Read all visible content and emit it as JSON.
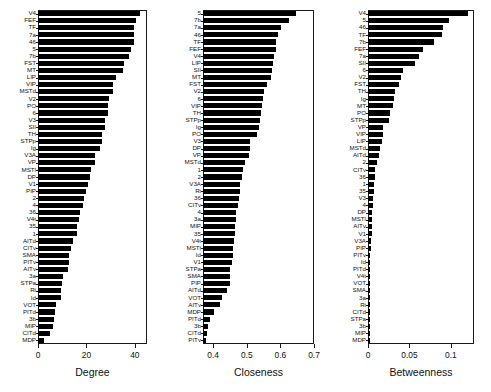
{
  "figure": {
    "background": "#ffffff",
    "bar_color": "#000000",
    "axis_color": "#1a1a1a",
    "text_color": "#111111"
  },
  "chart_data": [
    {
      "type": "bar",
      "orientation": "horizontal",
      "title": "",
      "xlabel": "Degree",
      "ylabel": "",
      "xlim": [
        0,
        45
      ],
      "xticks": [
        0,
        20,
        40
      ],
      "xticklabels": [
        "0",
        "20",
        "40"
      ],
      "grid": false,
      "legend": null,
      "categories": [
        "V4",
        "FEF",
        "TF",
        "7a",
        "46",
        "5",
        "7b",
        "FST",
        "MT",
        "LIP",
        "VIP",
        "MSTd",
        "V2",
        "PO",
        "6",
        "V3",
        "SII",
        "TH",
        "STPp",
        "Ig",
        "V3A",
        "VP",
        "MSTl",
        "DP",
        "V1",
        "PIP",
        "2",
        "4",
        "36",
        "V4t",
        "35",
        "1",
        "AITd",
        "CITv",
        "SMA",
        "PITv",
        "AITv",
        "3a",
        "STPa",
        "Ri",
        "Id",
        "VOT",
        "PITd",
        "3b",
        "MIP",
        "CITd",
        "MDP"
      ],
      "values": [
        42,
        40.5,
        39.5,
        39.5,
        39.5,
        38.5,
        37.5,
        35.5,
        35,
        32,
        31,
        31,
        29.5,
        29,
        29,
        27.5,
        27.5,
        26.5,
        26.5,
        25.5,
        23.5,
        23.5,
        22,
        21.5,
        20.5,
        20,
        19,
        18.5,
        17.5,
        17,
        16,
        16,
        14.5,
        13.5,
        13,
        13,
        12.5,
        10.5,
        10,
        9.5,
        9.5,
        7.5,
        7,
        6.5,
        6,
        5,
        2.5
      ]
    },
    {
      "type": "bar",
      "orientation": "horizontal",
      "title": "",
      "xlabel": "Closeness",
      "ylabel": "",
      "xlim": [
        0.37,
        0.7
      ],
      "xticks": [
        0.4,
        0.5,
        0.6,
        0.7
      ],
      "xticklabels": [
        "0.4",
        "0.5",
        "0.6",
        "0.7"
      ],
      "grid": false,
      "legend": null,
      "categories": [
        "5",
        "7b",
        "7a",
        "46",
        "TF",
        "FEF",
        "V4",
        "LIP",
        "SII",
        "MT",
        "FST",
        "V2",
        "6",
        "VIP",
        "TH",
        "STPp",
        "Ig",
        "PO",
        "V3",
        "DP",
        "VP",
        "MSTd",
        "1",
        "2",
        "V3A",
        "Ri",
        "36",
        "CITv",
        "4",
        "3a",
        "MIP",
        "35",
        "V4t",
        "MSTl",
        "Id",
        "V1",
        "STPa",
        "SMA",
        "PIP",
        "AITd",
        "VOT",
        "AITv",
        "MDP",
        "PITd",
        "3b",
        "CITd",
        "PITv"
      ],
      "values": [
        0.645,
        0.625,
        0.602,
        0.594,
        0.588,
        0.588,
        0.58,
        0.578,
        0.575,
        0.573,
        0.56,
        0.551,
        0.548,
        0.546,
        0.543,
        0.54,
        0.537,
        0.532,
        0.51,
        0.509,
        0.508,
        0.496,
        0.489,
        0.485,
        0.48,
        0.479,
        0.478,
        0.475,
        0.469,
        0.467,
        0.466,
        0.464,
        0.462,
        0.46,
        0.458,
        0.455,
        0.45,
        0.45,
        0.449,
        0.44,
        0.425,
        0.42,
        0.402,
        0.392,
        0.386,
        0.383,
        0.378
      ]
    },
    {
      "type": "bar",
      "orientation": "horizontal",
      "title": "",
      "xlabel": "Betweenness",
      "ylabel": "",
      "xlim": [
        0,
        0.128
      ],
      "xticks": [
        0,
        0.05,
        0.1
      ],
      "xticklabels": [
        "0",
        "0.05",
        "0.1"
      ],
      "grid": false,
      "legend": null,
      "categories": [
        "V4",
        "5",
        "46",
        "TF",
        "7b",
        "FEF",
        "7a",
        "SII",
        "6",
        "V2",
        "FST",
        "TH",
        "Ig",
        "MT",
        "PO",
        "STPp",
        "VP",
        "VIP",
        "LIP",
        "MSTd",
        "AITd",
        "2",
        "CITv",
        "36",
        "1",
        "35",
        "V3",
        "4",
        "DP",
        "MSTl",
        "AITv",
        "V1",
        "V3A",
        "PIP",
        "PITv",
        "Id",
        "PITd",
        "V4t",
        "VOT",
        "SMA",
        "3a",
        "Ri",
        "CITd",
        "STPa",
        "3b",
        "MIP",
        "MDP"
      ],
      "values": [
        0.121,
        0.098,
        0.091,
        0.089,
        0.08,
        0.066,
        0.062,
        0.057,
        0.042,
        0.04,
        0.037,
        0.032,
        0.031,
        0.03,
        0.027,
        0.025,
        0.018,
        0.018,
        0.017,
        0.014,
        0.013,
        0.011,
        0.009,
        0.008,
        0.007,
        0.007,
        0.006,
        0.006,
        0.005,
        0.005,
        0.005,
        0.005,
        0.004,
        0.004,
        0.002,
        0.002,
        0.002,
        0.001,
        0.001,
        0.0008,
        0.0006,
        0.0006,
        0.0005,
        0.0004,
        0.0002,
        0.0001,
        0.0
      ]
    }
  ],
  "panels": [
    {
      "name": "degree-panel",
      "axis_title": "Degree"
    },
    {
      "name": "closeness-panel",
      "axis_title": "Closeness"
    },
    {
      "name": "betweenness-panel",
      "axis_title": "Betweenness"
    }
  ]
}
